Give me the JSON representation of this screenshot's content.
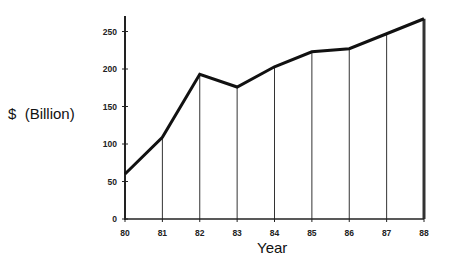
{
  "chart_data": {
    "type": "line",
    "title": "",
    "xlabel": "Year",
    "ylabel": "$  (Billion)",
    "categories": [
      "80",
      "81",
      "82",
      "83",
      "84",
      "85",
      "86",
      "87",
      "88"
    ],
    "values": [
      60,
      109,
      193,
      176,
      203,
      223,
      227,
      247,
      267
    ],
    "yticks": [
      0,
      50,
      100,
      150,
      200,
      250
    ],
    "ylim": [
      0,
      270
    ],
    "grid": false,
    "drop_lines": true,
    "legend": null,
    "colors": {
      "line": "#111111",
      "axis": "#222222",
      "drop_line": "#333333"
    }
  }
}
